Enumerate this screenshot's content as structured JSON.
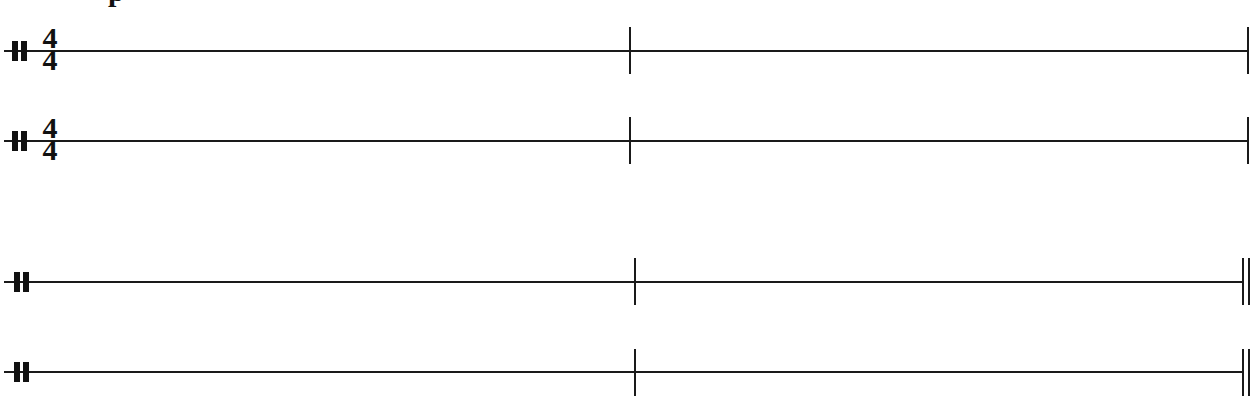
{
  "title_fragment": "p",
  "colors": {
    "ink": "#1a1a1a",
    "background": "#ffffff"
  },
  "systems": [
    {
      "staves": [
        {
          "clef": "percussion-clef",
          "time_signature": {
            "numerator": "4",
            "denominator": "4"
          },
          "measures": 2,
          "final_barline": "single"
        },
        {
          "clef": "percussion-clef",
          "time_signature": {
            "numerator": "4",
            "denominator": "4"
          },
          "measures": 2,
          "final_barline": "single"
        }
      ]
    },
    {
      "staves": [
        {
          "clef": "percussion-clef",
          "time_signature": null,
          "measures": 2,
          "final_barline": "double"
        },
        {
          "clef": "percussion-clef",
          "time_signature": null,
          "measures": 2,
          "final_barline": "double"
        }
      ]
    }
  ]
}
